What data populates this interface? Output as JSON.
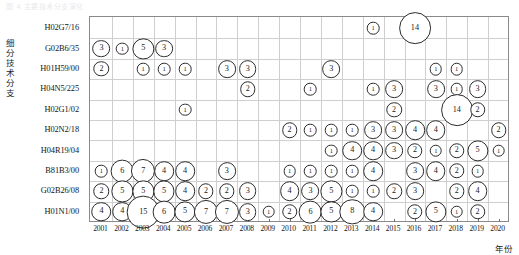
{
  "faint_header": "图 4 主要技术分支演化",
  "axes": {
    "y_title": "细分技术分支",
    "x_title": "年份"
  },
  "chart_data": {
    "type": "scatter",
    "subtype": "bubble",
    "title": "",
    "xlabel": "年份",
    "ylabel": "细分技术分支",
    "grid": true,
    "legend": "none",
    "x": [
      2001,
      2002,
      2003,
      2004,
      2005,
      2006,
      2007,
      2008,
      2009,
      2010,
      2011,
      2012,
      2013,
      2014,
      2015,
      2016,
      2017,
      2018,
      2019,
      2020
    ],
    "categories": [
      "H02G7/16",
      "G02B6/35",
      "H01H59/00",
      "H04N5/225",
      "H02G1/02",
      "H02N2/18",
      "H04R19/04",
      "B81B3/00",
      "G02B26/08",
      "H01N1/00"
    ],
    "value_range": [
      1,
      15
    ],
    "points": [
      {
        "category": "H02G7/16",
        "year": 2014,
        "value": 1
      },
      {
        "category": "H02G7/16",
        "year": 2016,
        "value": 14
      },
      {
        "category": "G02B6/35",
        "year": 2001,
        "value": 3
      },
      {
        "category": "G02B6/35",
        "year": 2002,
        "value": 1
      },
      {
        "category": "G02B6/35",
        "year": 2003,
        "value": 5
      },
      {
        "category": "G02B6/35",
        "year": 2004,
        "value": 3
      },
      {
        "category": "H01H59/00",
        "year": 2001,
        "value": 2
      },
      {
        "category": "H01H59/00",
        "year": 2003,
        "value": 1
      },
      {
        "category": "H01H59/00",
        "year": 2004,
        "value": 1
      },
      {
        "category": "H01H59/00",
        "year": 2005,
        "value": 1
      },
      {
        "category": "H01H59/00",
        "year": 2007,
        "value": 3
      },
      {
        "category": "H01H59/00",
        "year": 2008,
        "value": 3
      },
      {
        "category": "H01H59/00",
        "year": 2012,
        "value": 3
      },
      {
        "category": "H01H59/00",
        "year": 2017,
        "value": 1
      },
      {
        "category": "H01H59/00",
        "year": 2018,
        "value": 1
      },
      {
        "category": "H04N5/225",
        "year": 2008,
        "value": 2
      },
      {
        "category": "H04N5/225",
        "year": 2011,
        "value": 1
      },
      {
        "category": "H04N5/225",
        "year": 2014,
        "value": 1
      },
      {
        "category": "H04N5/225",
        "year": 2015,
        "value": 3
      },
      {
        "category": "H04N5/225",
        "year": 2017,
        "value": 3
      },
      {
        "category": "H04N5/225",
        "year": 2018,
        "value": 1
      },
      {
        "category": "H04N5/225",
        "year": 2019,
        "value": 3
      },
      {
        "category": "H02G1/02",
        "year": 2005,
        "value": 1
      },
      {
        "category": "H02G1/02",
        "year": 2015,
        "value": 2
      },
      {
        "category": "H02G1/02",
        "year": 2018,
        "value": 14
      },
      {
        "category": "H02G1/02",
        "year": 2019,
        "value": 2
      },
      {
        "category": "H02N2/18",
        "year": 2010,
        "value": 2
      },
      {
        "category": "H02N2/18",
        "year": 2011,
        "value": 1
      },
      {
        "category": "H02N2/18",
        "year": 2012,
        "value": 1
      },
      {
        "category": "H02N2/18",
        "year": 2013,
        "value": 1
      },
      {
        "category": "H02N2/18",
        "year": 2014,
        "value": 3
      },
      {
        "category": "H02N2/18",
        "year": 2015,
        "value": 3
      },
      {
        "category": "H02N2/18",
        "year": 2016,
        "value": 4
      },
      {
        "category": "H02N2/18",
        "year": 2017,
        "value": 4
      },
      {
        "category": "H02N2/18",
        "year": 2020,
        "value": 2
      },
      {
        "category": "H04R19/04",
        "year": 2012,
        "value": 1
      },
      {
        "category": "H04R19/04",
        "year": 2013,
        "value": 4
      },
      {
        "category": "H04R19/04",
        "year": 2014,
        "value": 4
      },
      {
        "category": "H04R19/04",
        "year": 2015,
        "value": 3
      },
      {
        "category": "H04R19/04",
        "year": 2016,
        "value": 2
      },
      {
        "category": "H04R19/04",
        "year": 2017,
        "value": 1
      },
      {
        "category": "H04R19/04",
        "year": 2018,
        "value": 2
      },
      {
        "category": "H04R19/04",
        "year": 2019,
        "value": 5
      },
      {
        "category": "H04R19/04",
        "year": 2020,
        "value": 1
      },
      {
        "category": "B81B3/00",
        "year": 2001,
        "value": 1
      },
      {
        "category": "B81B3/00",
        "year": 2002,
        "value": 6
      },
      {
        "category": "B81B3/00",
        "year": 2003,
        "value": 7
      },
      {
        "category": "B81B3/00",
        "year": 2004,
        "value": 4
      },
      {
        "category": "B81B3/00",
        "year": 2005,
        "value": 4
      },
      {
        "category": "B81B3/00",
        "year": 2007,
        "value": 3
      },
      {
        "category": "B81B3/00",
        "year": 2010,
        "value": 1
      },
      {
        "category": "B81B3/00",
        "year": 2011,
        "value": 1
      },
      {
        "category": "B81B3/00",
        "year": 2012,
        "value": 1
      },
      {
        "category": "B81B3/00",
        "year": 2013,
        "value": 1
      },
      {
        "category": "B81B3/00",
        "year": 2014,
        "value": 4
      },
      {
        "category": "B81B3/00",
        "year": 2016,
        "value": 3
      },
      {
        "category": "B81B3/00",
        "year": 2017,
        "value": 4
      },
      {
        "category": "B81B3/00",
        "year": 2018,
        "value": 2
      },
      {
        "category": "B81B3/00",
        "year": 2019,
        "value": 1
      },
      {
        "category": "G02B26/08",
        "year": 2001,
        "value": 2
      },
      {
        "category": "G02B26/08",
        "year": 2002,
        "value": 5
      },
      {
        "category": "G02B26/08",
        "year": 2003,
        "value": 5
      },
      {
        "category": "G02B26/08",
        "year": 2004,
        "value": 5
      },
      {
        "category": "G02B26/08",
        "year": 2005,
        "value": 4
      },
      {
        "category": "G02B26/08",
        "year": 2006,
        "value": 2
      },
      {
        "category": "G02B26/08",
        "year": 2007,
        "value": 2
      },
      {
        "category": "G02B26/08",
        "year": 2008,
        "value": 3
      },
      {
        "category": "G02B26/08",
        "year": 2010,
        "value": 4
      },
      {
        "category": "G02B26/08",
        "year": 2011,
        "value": 3
      },
      {
        "category": "G02B26/08",
        "year": 2012,
        "value": 5
      },
      {
        "category": "G02B26/08",
        "year": 2013,
        "value": 1
      },
      {
        "category": "G02B26/08",
        "year": 2014,
        "value": 1
      },
      {
        "category": "G02B26/08",
        "year": 2015,
        "value": 2
      },
      {
        "category": "G02B26/08",
        "year": 2016,
        "value": 3
      },
      {
        "category": "G02B26/08",
        "year": 2018,
        "value": 2
      },
      {
        "category": "G02B26/08",
        "year": 2019,
        "value": 4
      },
      {
        "category": "H01N1/00",
        "year": 2001,
        "value": 4
      },
      {
        "category": "H01N1/00",
        "year": 2002,
        "value": 4
      },
      {
        "category": "H01N1/00",
        "year": 2003,
        "value": 15
      },
      {
        "category": "H01N1/00",
        "year": 2004,
        "value": 6
      },
      {
        "category": "H01N1/00",
        "year": 2005,
        "value": 5
      },
      {
        "category": "H01N1/00",
        "year": 2006,
        "value": 7
      },
      {
        "category": "H01N1/00",
        "year": 2007,
        "value": 7
      },
      {
        "category": "H01N1/00",
        "year": 2008,
        "value": 3
      },
      {
        "category": "H01N1/00",
        "year": 2009,
        "value": 1
      },
      {
        "category": "H01N1/00",
        "year": 2010,
        "value": 2
      },
      {
        "category": "H01N1/00",
        "year": 2011,
        "value": 6
      },
      {
        "category": "H01N1/00",
        "year": 2012,
        "value": 5
      },
      {
        "category": "H01N1/00",
        "year": 2013,
        "value": 8
      },
      {
        "category": "H01N1/00",
        "year": 2014,
        "value": 4
      },
      {
        "category": "H01N1/00",
        "year": 2016,
        "value": 2
      },
      {
        "category": "H01N1/00",
        "year": 2017,
        "value": 5
      },
      {
        "category": "H01N1/00",
        "year": 2018,
        "value": 1
      },
      {
        "category": "H01N1/00",
        "year": 2019,
        "value": 2
      }
    ]
  },
  "colors": {
    "bubble_stroke": "#2b2b2b",
    "bubble_fill": "#ffffff",
    "grid": "#cfcfcf",
    "frame": "#8a8a8a",
    "text": "#161616"
  }
}
